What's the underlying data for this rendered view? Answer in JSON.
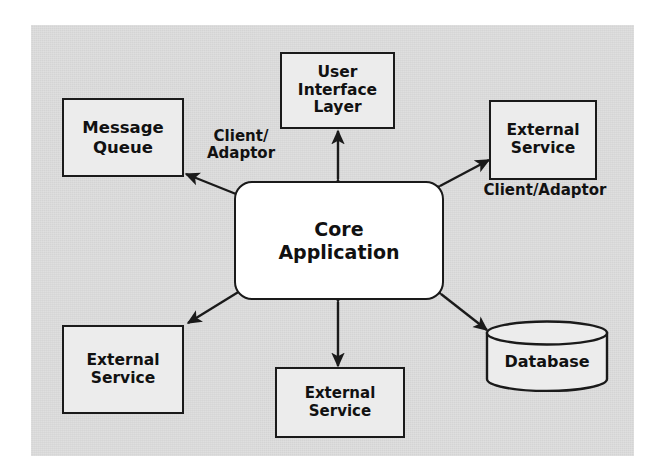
{
  "figure": {
    "background_color": "#d9d9d9",
    "node_fill": "#ececec",
    "core_fill": "#ffffff",
    "stroke_color": "#1a1a1a"
  },
  "nodes": {
    "message_queue": {
      "label": "Message\nQueue",
      "shape": "rectangle"
    },
    "ui_layer": {
      "label": "User\nInterface\nLayer",
      "shape": "rectangle"
    },
    "external_service_right": {
      "label": "External\nService",
      "shape": "rectangle"
    },
    "core_application": {
      "label": "Core\nApplication",
      "shape": "rounded-rectangle"
    },
    "external_service_left": {
      "label": "External\nService",
      "shape": "rectangle"
    },
    "external_service_bottom": {
      "label": "External\nService",
      "shape": "rectangle"
    },
    "database": {
      "label": "Database",
      "shape": "cylinder"
    }
  },
  "edge_labels": {
    "client_adaptor_left": "Client/\nAdaptor",
    "client_adaptor_right": "Client/Adaptor"
  },
  "connections": [
    {
      "from": "core_application",
      "to": "message_queue",
      "arrow": "double",
      "label": "Client/Adaptor"
    },
    {
      "from": "core_application",
      "to": "ui_layer",
      "arrow": "double",
      "label": ""
    },
    {
      "from": "core_application",
      "to": "external_service_right",
      "arrow": "double",
      "label": "Client/Adaptor"
    },
    {
      "from": "core_application",
      "to": "external_service_left",
      "arrow": "double",
      "label": ""
    },
    {
      "from": "core_application",
      "to": "external_service_bottom",
      "arrow": "double",
      "label": ""
    },
    {
      "from": "core_application",
      "to": "database",
      "arrow": "double",
      "label": ""
    }
  ]
}
